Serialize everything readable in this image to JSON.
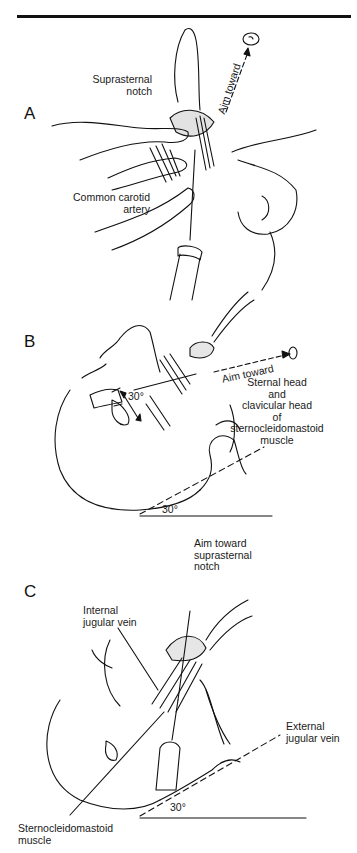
{
  "figure": {
    "panels": [
      {
        "id": "A",
        "letter": "A",
        "labels": {
          "suprasternal_notch": [
            "Suprasternal",
            "notch"
          ],
          "aim_toward": "Aim toward",
          "common_carotid_artery": [
            "Common carotid",
            "artery"
          ]
        }
      },
      {
        "id": "B",
        "letter": "B",
        "labels": {
          "aim_toward": "Aim toward",
          "angle_needle": "30°",
          "angle_table": "30°",
          "sternal_head": [
            "Sternal head",
            "and",
            "clavicular head",
            "of",
            "sternocleidomastoid",
            "muscle"
          ]
        }
      },
      {
        "id": "C",
        "letter": "C",
        "labels": {
          "aim_toward": [
            "Aim toward",
            "suprasternal",
            "notch"
          ],
          "internal_jugular_vein": [
            "Internal",
            "jugular vein"
          ],
          "external_jugular_vein": [
            "External",
            "jugular vein"
          ],
          "angle_table": "30°",
          "sternocleidomastoid_muscle": [
            "Sternocleidomastoid",
            "muscle"
          ]
        }
      }
    ]
  },
  "colors": {
    "ink": "#111111",
    "background": "#ffffff",
    "shade": "#bdbdbd"
  }
}
